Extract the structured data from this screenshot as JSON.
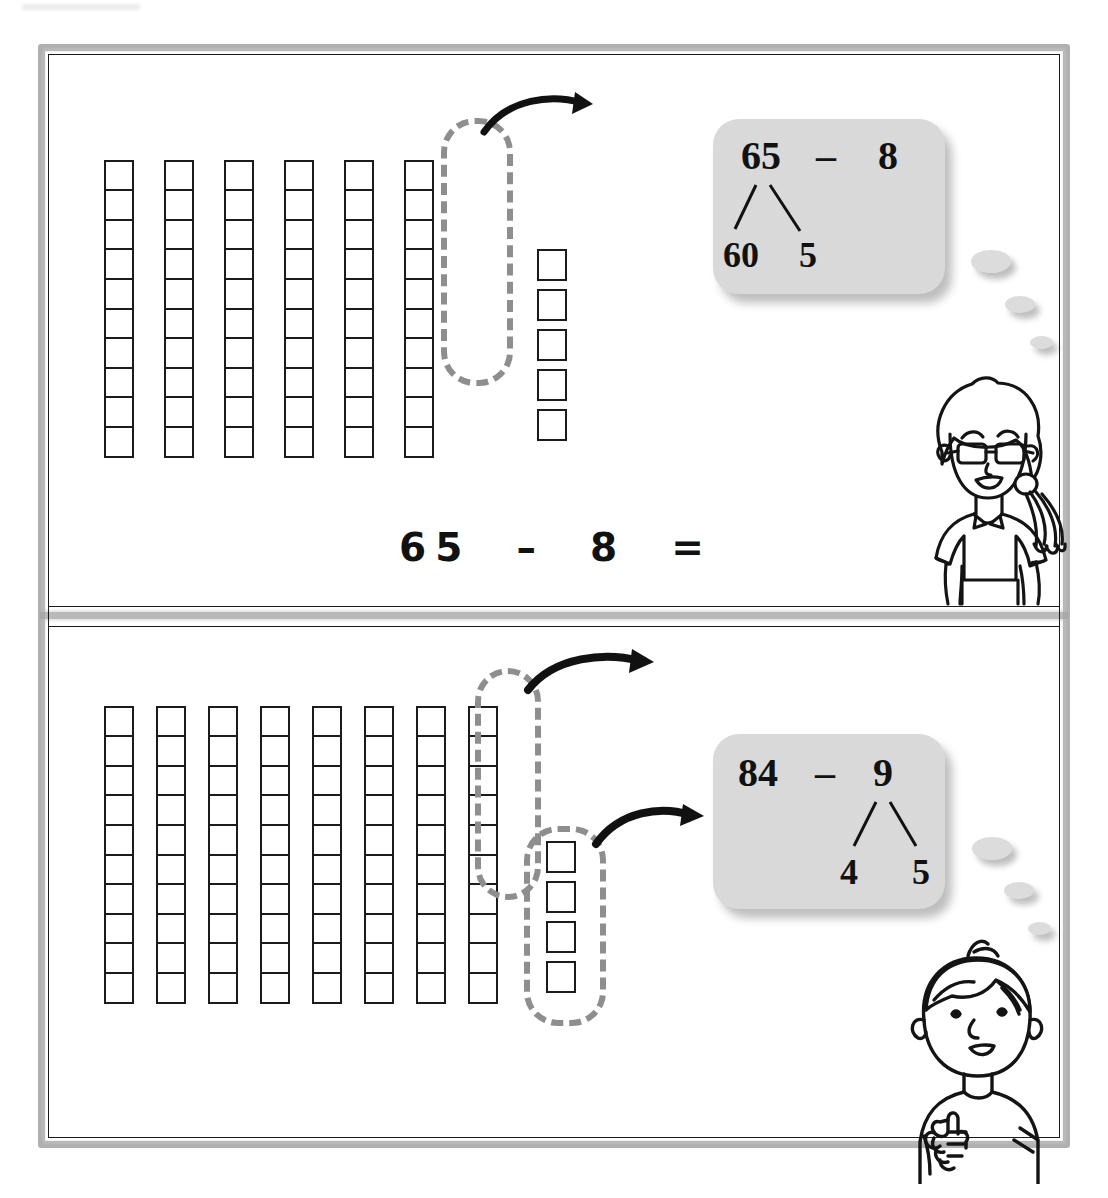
{
  "worksheet": {
    "title": "Subtraction with regrouping using base-ten blocks",
    "frame_color": "#9b9b9b",
    "ink_color": "#1a1a1a",
    "bubble_color": "#d9d9d9",
    "lasso_color": "#8e8e8e"
  },
  "problems": [
    {
      "id": "problem-1",
      "equation": "65  –  8  =",
      "answer": "",
      "minuend": 65,
      "subtrahend": 8,
      "blocks": {
        "rods": 6,
        "cells_per_rod": 10,
        "loose_units": 5,
        "circled_rod_index": 6,
        "circled_units": 0
      },
      "bubble": {
        "expression_left": "65",
        "operator": "–",
        "expression_right": "8",
        "bond_source": "65",
        "bond_part_left": "60",
        "bond_part_right": "5"
      },
      "character": "girl-with-glasses",
      "arrows": 1
    },
    {
      "id": "problem-2",
      "equation": "84  –  9  =",
      "answer": "",
      "minuend": 84,
      "subtrahend": 9,
      "blocks": {
        "rods": 8,
        "cells_per_rod": 10,
        "loose_units": 4,
        "circled_rod_index": 8,
        "circled_units": 4
      },
      "bubble": {
        "expression_left": "84",
        "operator": "–",
        "expression_right": "9",
        "bond_source": "9",
        "bond_part_left": "4",
        "bond_part_right": "5"
      },
      "character": "boy-thumbs-up",
      "arrows": 2
    }
  ]
}
